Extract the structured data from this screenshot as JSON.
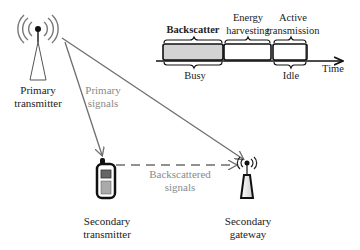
{
  "diagram": {
    "nodes": {
      "primary_transmitter": {
        "label_line1": "Primary",
        "label_line2": "transmitter"
      },
      "secondary_transmitter": {
        "label_line1": "Secondary",
        "label_line2": "transmitter"
      },
      "secondary_gateway": {
        "label_line1": "Secondary",
        "label_line2": "gateway"
      }
    },
    "edges": {
      "primary_signals": {
        "label_line1": "Primary",
        "label_line2": "signals",
        "style": "solid",
        "color": "#6e6e6e"
      },
      "backscattered_signals": {
        "label_line1": "Backscattered",
        "label_line2": "signals",
        "style": "dashed",
        "color": "#6e6e6e"
      }
    },
    "timeline": {
      "segments": [
        {
          "label": "Backscatter",
          "fill": "#d3d3d3"
        },
        {
          "label_line1": "Energy",
          "label_line2": "harvesting",
          "fill": "#ffffff"
        },
        {
          "label_line1": "Active",
          "label_line2": "transmission",
          "fill": "#ffffff"
        }
      ],
      "states": {
        "busy": "Busy",
        "idle": "Idle"
      },
      "axis_label": "Time"
    }
  }
}
